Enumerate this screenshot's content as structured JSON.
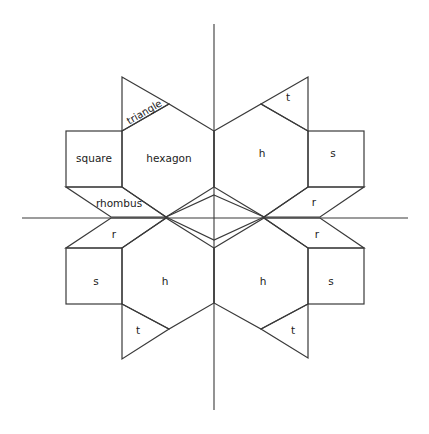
{
  "diagram": {
    "labels": {
      "triangle": "triangle",
      "square": "square",
      "hexagon": "hexagon",
      "rhombus": "rhombus",
      "t_tr": "t",
      "h_tr": "h",
      "s_tr": "s",
      "r_tr": "r",
      "r_bl": "r",
      "s_bl": "s",
      "h_bl": "h",
      "t_bl": "t",
      "r_br": "r",
      "h_br": "h",
      "s_br": "s",
      "t_br": "t"
    },
    "colors": {
      "line": "#3a3a3a",
      "text": "#222222",
      "background": "#ffffff"
    }
  }
}
